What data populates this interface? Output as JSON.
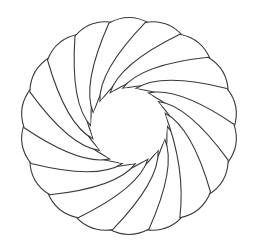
{
  "figure": {
    "type": "spiral-rosette",
    "petal_count": 18,
    "center": [
      129,
      126
    ],
    "inner_radius": 38,
    "outer_radius": 114,
    "twist_deg": 70,
    "stroke_color": "#3a3a3a",
    "fill_color": "#ffffff",
    "background": "#ffffff"
  }
}
